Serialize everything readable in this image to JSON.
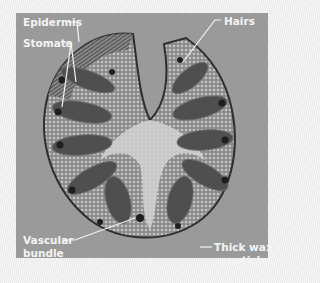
{
  "figure": {
    "colors": {
      "background": "#f2f2f2",
      "panel": "#9a9a9a",
      "label_text": "#f4f4f4",
      "tissue_dark": "#4a4a4a",
      "tissue_light": "#c8c8c8"
    },
    "labels": {
      "epidermis": "Epidermis",
      "stomata": "Stomata",
      "hairs": "Hairs",
      "vascular_line1": "Vascular",
      "vascular_line2": "bundle",
      "cuticle_line1": "Thick waxy",
      "cuticle_line2": "cuticle"
    }
  }
}
